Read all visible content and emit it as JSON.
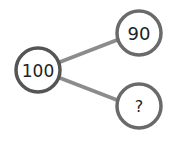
{
  "diagram": {
    "type": "number-bond",
    "whole": {
      "label": "100"
    },
    "parts": [
      {
        "label": "90"
      },
      {
        "label": "?"
      }
    ],
    "colors": {
      "circle_stroke": "#555555",
      "connector": "#8c8c8c",
      "text": "#222222",
      "background": "#ffffff"
    }
  }
}
